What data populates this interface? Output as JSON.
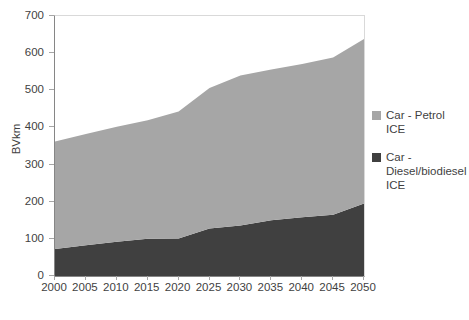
{
  "chart_data": {
    "type": "area",
    "stacked": true,
    "title": "",
    "xlabel": "",
    "ylabel": "BVkm",
    "x": [
      2000,
      2005,
      2010,
      2015,
      2020,
      2025,
      2030,
      2035,
      2040,
      2045,
      2050
    ],
    "xlim": [
      2000,
      2050
    ],
    "ylim": [
      0,
      700
    ],
    "ytick_labels": [
      "0",
      "100",
      "200",
      "300",
      "400",
      "500",
      "600",
      "700"
    ],
    "ytick_values": [
      0,
      100,
      200,
      300,
      400,
      500,
      600,
      700
    ],
    "xtick_labels": [
      "2000",
      "2005",
      "2010",
      "2015",
      "2020",
      "2025",
      "2030",
      "2035",
      "2040",
      "2045",
      "2050"
    ],
    "grid": false,
    "legend_position": "right",
    "series": [
      {
        "name": "Car - Diesel/biodiesel ICE",
        "color": "#404040",
        "values": [
          73,
          83,
          92,
          100,
          101,
          128,
          136,
          150,
          158,
          165,
          195
        ]
      },
      {
        "name": "Car - Petrol ICE",
        "color": "#a6a6a6",
        "values": [
          289,
          299,
          310,
          319,
          342,
          378,
          404,
          406,
          413,
          423,
          443
        ]
      }
    ],
    "totals": [
      362,
      382,
      402,
      419,
      443,
      506,
      540,
      556,
      571,
      588,
      638
    ]
  },
  "axes": {
    "y_title": "BVkm"
  },
  "legend": {
    "items": [
      {
        "label": "Car - Petrol ICE",
        "color": "#a6a6a6"
      },
      {
        "label": "Car - Diesel/biodiesel ICE",
        "color": "#404040"
      }
    ]
  }
}
